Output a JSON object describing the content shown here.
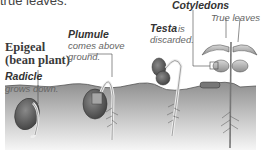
{
  "intro_fragment": "true leaves.",
  "diagram": {
    "title_line1": "Epigeal",
    "title_line2": "(bean plant)",
    "labels": {
      "radicle_term": "Radicle",
      "radicle_desc": "grows down.",
      "plumule_term": "Plumule",
      "plumule_desc1": "comes above",
      "plumule_desc2": "ground.",
      "testa_term": "Testa",
      "testa_desc1": "is",
      "testa_desc2": "discarded.",
      "cotyledons_term": "Cotyledons",
      "true_leaves": "True leaves"
    },
    "stages": [
      "seed-germinating",
      "plumule-emerging",
      "testa-discarded",
      "mature-seedling"
    ],
    "colors": {
      "soil_top": "#8a8a8a",
      "soil_bottom": "#f4f4f4",
      "seed": "#6e6e6e",
      "leaf": "#bdbdbd"
    }
  }
}
